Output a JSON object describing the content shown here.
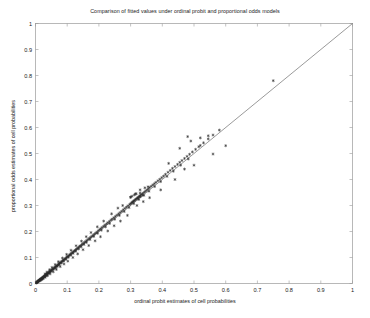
{
  "chart_data": {
    "type": "scatter",
    "title": "Comparison of fitted values under ordinal probit and proportional odds models",
    "xlabel": "ordinal probit estimates of cell probabilities",
    "ylabel": "proportional odds estimates of cell probabilities",
    "xlim": [
      0,
      1
    ],
    "ylim": [
      0,
      1
    ],
    "xticks": [
      0,
      0.1,
      0.2,
      0.3,
      0.4,
      0.5,
      0.6,
      0.7,
      0.8,
      0.9,
      1
    ],
    "yticks": [
      0,
      0.1,
      0.2,
      0.3,
      0.4,
      0.5,
      0.6,
      0.7,
      0.8,
      0.9,
      1
    ],
    "xticklabels": [
      "0",
      "0.1",
      "0.2",
      "0.3",
      "0.4",
      "0.5",
      "0.6",
      "0.7",
      "0.8",
      "0.9",
      "1"
    ],
    "yticklabels": [
      "0",
      "0.1",
      "0.2",
      "0.3",
      "0.4",
      "0.5",
      "0.6",
      "0.7",
      "0.8",
      "0.9",
      "1"
    ],
    "grid": false,
    "legend": null,
    "marker": "asterisk",
    "marker_color": "#2b2b2b",
    "marker_size": 3.0,
    "reference_line": {
      "name": "identity-line",
      "from": [
        0,
        0
      ],
      "to": [
        1,
        1
      ],
      "color": "#555555",
      "width": 0.6
    },
    "series": [
      {
        "name": "cell probabilities",
        "x": [
          0.002,
          0.003,
          0.004,
          0.004,
          0.005,
          0.006,
          0.006,
          0.007,
          0.008,
          0.008,
          0.009,
          0.01,
          0.01,
          0.011,
          0.012,
          0.012,
          0.013,
          0.014,
          0.015,
          0.015,
          0.016,
          0.017,
          0.018,
          0.019,
          0.02,
          0.021,
          0.022,
          0.023,
          0.024,
          0.025,
          0.026,
          0.027,
          0.028,
          0.03,
          0.031,
          0.032,
          0.034,
          0.035,
          0.036,
          0.038,
          0.04,
          0.041,
          0.043,
          0.045,
          0.047,
          0.048,
          0.05,
          0.052,
          0.054,
          0.056,
          0.058,
          0.06,
          0.062,
          0.064,
          0.066,
          0.068,
          0.07,
          0.072,
          0.074,
          0.076,
          0.078,
          0.08,
          0.083,
          0.085,
          0.088,
          0.09,
          0.093,
          0.095,
          0.098,
          0.1,
          0.103,
          0.106,
          0.108,
          0.111,
          0.114,
          0.117,
          0.12,
          0.123,
          0.126,
          0.129,
          0.132,
          0.135,
          0.138,
          0.141,
          0.145,
          0.148,
          0.152,
          0.155,
          0.159,
          0.162,
          0.166,
          0.17,
          0.174,
          0.178,
          0.182,
          0.186,
          0.19,
          0.194,
          0.198,
          0.202,
          0.206,
          0.21,
          0.215,
          0.219,
          0.224,
          0.228,
          0.233,
          0.238,
          0.242,
          0.247,
          0.252,
          0.257,
          0.262,
          0.267,
          0.272,
          0.277,
          0.282,
          0.287,
          0.292,
          0.297,
          0.3,
          0.303,
          0.305,
          0.307,
          0.309,
          0.311,
          0.313,
          0.315,
          0.318,
          0.32,
          0.322,
          0.325,
          0.328,
          0.33,
          0.333,
          0.336,
          0.34,
          0.344,
          0.348,
          0.352,
          0.356,
          0.36,
          0.365,
          0.37,
          0.375,
          0.38,
          0.386,
          0.392,
          0.398,
          0.404,
          0.41,
          0.418,
          0.425,
          0.432,
          0.44,
          0.448,
          0.455,
          0.462,
          0.47,
          0.478,
          0.486,
          0.495,
          0.505,
          0.515,
          0.52,
          0.53,
          0.545,
          0.56,
          0.58,
          0.75,
          0.018,
          0.022,
          0.029,
          0.033,
          0.037,
          0.042,
          0.046,
          0.051,
          0.057,
          0.063,
          0.069,
          0.075,
          0.082,
          0.089,
          0.096,
          0.104,
          0.112,
          0.119,
          0.127,
          0.136,
          0.144,
          0.153,
          0.161,
          0.172,
          0.184,
          0.196,
          0.208,
          0.221,
          0.234,
          0.25,
          0.265,
          0.28,
          0.295,
          0.31,
          0.326,
          0.342,
          0.358,
          0.376,
          0.395,
          0.415,
          0.435,
          0.458,
          0.482,
          0.3,
          0.305,
          0.312,
          0.318,
          0.324,
          0.331,
          0.338
        ],
        "y": [
          0.002,
          0.003,
          0.004,
          0.005,
          0.005,
          0.006,
          0.007,
          0.007,
          0.008,
          0.009,
          0.009,
          0.01,
          0.011,
          0.011,
          0.012,
          0.013,
          0.013,
          0.014,
          0.015,
          0.016,
          0.016,
          0.017,
          0.018,
          0.019,
          0.02,
          0.021,
          0.022,
          0.023,
          0.024,
          0.025,
          0.026,
          0.027,
          0.029,
          0.03,
          0.031,
          0.033,
          0.034,
          0.036,
          0.037,
          0.039,
          0.04,
          0.042,
          0.044,
          0.046,
          0.047,
          0.049,
          0.051,
          0.053,
          0.055,
          0.057,
          0.059,
          0.061,
          0.063,
          0.065,
          0.067,
          0.069,
          0.071,
          0.073,
          0.076,
          0.078,
          0.08,
          0.082,
          0.085,
          0.087,
          0.09,
          0.092,
          0.095,
          0.097,
          0.1,
          0.103,
          0.105,
          0.108,
          0.111,
          0.114,
          0.117,
          0.12,
          0.123,
          0.126,
          0.129,
          0.132,
          0.135,
          0.138,
          0.142,
          0.145,
          0.148,
          0.152,
          0.155,
          0.159,
          0.162,
          0.166,
          0.17,
          0.174,
          0.178,
          0.182,
          0.186,
          0.19,
          0.194,
          0.198,
          0.203,
          0.207,
          0.211,
          0.216,
          0.22,
          0.225,
          0.229,
          0.234,
          0.239,
          0.244,
          0.248,
          0.253,
          0.258,
          0.263,
          0.268,
          0.273,
          0.278,
          0.284,
          0.289,
          0.294,
          0.299,
          0.304,
          0.307,
          0.31,
          0.312,
          0.314,
          0.316,
          0.318,
          0.32,
          0.323,
          0.325,
          0.327,
          0.33,
          0.333,
          0.335,
          0.338,
          0.341,
          0.344,
          0.348,
          0.352,
          0.356,
          0.36,
          0.364,
          0.369,
          0.374,
          0.379,
          0.384,
          0.389,
          0.395,
          0.401,
          0.407,
          0.413,
          0.42,
          0.428,
          0.435,
          0.443,
          0.45,
          0.458,
          0.466,
          0.473,
          0.481,
          0.489,
          0.497,
          0.506,
          0.516,
          0.526,
          0.531,
          0.541,
          0.556,
          0.571,
          0.59,
          0.78,
          0.016,
          0.02,
          0.027,
          0.031,
          0.035,
          0.04,
          0.044,
          0.049,
          0.055,
          0.06,
          0.066,
          0.072,
          0.079,
          0.086,
          0.093,
          0.101,
          0.109,
          0.116,
          0.124,
          0.133,
          0.141,
          0.15,
          0.158,
          0.169,
          0.181,
          0.193,
          0.205,
          0.218,
          0.231,
          0.247,
          0.262,
          0.277,
          0.292,
          0.307,
          0.323,
          0.339,
          0.355,
          0.373,
          0.392,
          0.412,
          0.432,
          0.455,
          0.479,
          0.332,
          0.336,
          0.341,
          0.345,
          0.328,
          0.334,
          0.34
        ]
      },
      {
        "name": "above-line outliers",
        "x": [
          0.3,
          0.315,
          0.33,
          0.355,
          0.42,
          0.455,
          0.48,
          0.49,
          0.52,
          0.545,
          0.33,
          0.345,
          0.26,
          0.275,
          0.24,
          0.215,
          0.195,
          0.175,
          0.16,
          0.145,
          0.128,
          0.112,
          0.098,
          0.085,
          0.072,
          0.062,
          0.052,
          0.044,
          0.036,
          0.03
        ],
        "y": [
          0.332,
          0.345,
          0.348,
          0.372,
          0.462,
          0.52,
          0.565,
          0.548,
          0.56,
          0.568,
          0.36,
          0.368,
          0.29,
          0.3,
          0.268,
          0.24,
          0.218,
          0.196,
          0.18,
          0.163,
          0.145,
          0.128,
          0.112,
          0.098,
          0.084,
          0.073,
          0.062,
          0.053,
          0.044,
          0.037
        ]
      },
      {
        "name": "below-line outliers",
        "x": [
          0.32,
          0.34,
          0.36,
          0.395,
          0.44,
          0.47,
          0.5,
          0.56,
          0.6,
          0.29,
          0.268,
          0.248,
          0.228,
          0.205,
          0.188,
          0.168,
          0.15,
          0.133,
          0.118,
          0.102,
          0.09,
          0.078,
          0.066,
          0.056,
          0.046,
          0.038,
          0.031,
          0.025,
          0.02,
          0.015
        ],
        "y": [
          0.3,
          0.315,
          0.33,
          0.36,
          0.4,
          0.44,
          0.455,
          0.498,
          0.53,
          0.262,
          0.24,
          0.222,
          0.202,
          0.18,
          0.164,
          0.146,
          0.13,
          0.114,
          0.1,
          0.086,
          0.075,
          0.065,
          0.054,
          0.045,
          0.037,
          0.03,
          0.024,
          0.019,
          0.015,
          0.011
        ]
      }
    ]
  }
}
